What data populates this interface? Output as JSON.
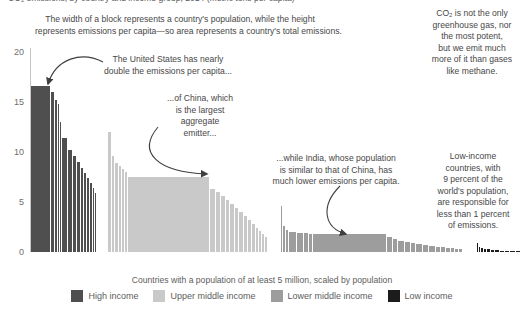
{
  "clipped_title": "CO₂ emissions, by country and income group, 2014 (metric tons per capita)",
  "annotations": {
    "width_note": {
      "lines": [
        "The width of a block represents a country's population, while the height",
        "represents emissions per capita—so area represents a country's total emissions."
      ]
    },
    "us_note": {
      "lines": [
        "The United States has nearly",
        "double the emissions per capita..."
      ]
    },
    "china_note": {
      "lines": [
        "...of China, which",
        "is the largest",
        "aggregate",
        "emitter..."
      ]
    },
    "india_note": {
      "lines": [
        "...while India, whose population",
        "is similar to that of China, has",
        "much lower emissions per capita."
      ]
    },
    "co2_note": {
      "lines": [
        "CO₂ is not the only",
        "greenhouse gas, nor",
        "the most potent,",
        "but we emit much",
        "more of it than gases",
        "like methane."
      ]
    },
    "low_income_note": {
      "lines": [
        "Low-income",
        "countries, with",
        "9 percent of the",
        "world's population,",
        "are responsible for",
        "less than 1 percent",
        "of emissions."
      ]
    }
  },
  "legend": {
    "items": [
      {
        "label": "High income",
        "color": "#4f4f4f"
      },
      {
        "label": "Upper middle income",
        "color": "#c9c9c9"
      },
      {
        "label": "Lower middle income",
        "color": "#9d9d9d"
      },
      {
        "label": "Low income",
        "color": "#1c1c1c"
      }
    ]
  },
  "chart_data": {
    "type": "bar",
    "variant": "marimekko — bar width proportional to country population, bar height = CO2 emissions per capita",
    "xlabel": "Countries with a population of at least 5 million, scaled by population",
    "ylabel": "metric tons per capita",
    "ylim": [
      0,
      20
    ],
    "yticks": [
      0,
      5,
      10,
      15,
      20
    ],
    "grid": false,
    "legend_position": "bottom",
    "highlight_values": {
      "united_states": 16.6,
      "china": 7.5,
      "india": 1.8
    },
    "series": [
      {
        "name": "High income",
        "color": "#4f4f4f",
        "x_start": 31,
        "bars": [
          [
            20,
            16.6,
            "United States"
          ],
          [
            4,
            16.0
          ],
          [
            3,
            15.2
          ],
          [
            2,
            14.8
          ],
          [
            2,
            13.0
          ],
          [
            6,
            11.4
          ],
          [
            5,
            10.2
          ],
          [
            4,
            9.6
          ],
          [
            4,
            9.0
          ],
          [
            3,
            8.4
          ],
          [
            3,
            7.9
          ],
          [
            3,
            7.4
          ],
          [
            3,
            6.9
          ],
          [
            2,
            6.4
          ],
          [
            2,
            5.9
          ]
        ]
      },
      {
        "name": "Upper middle income",
        "color": "#c9c9c9",
        "x_start": 108,
        "bars": [
          [
            4,
            12.0
          ],
          [
            3,
            9.6
          ],
          [
            4,
            8.9
          ],
          [
            3,
            8.6
          ],
          [
            3,
            8.3
          ],
          [
            3,
            8.0
          ],
          [
            82,
            7.5,
            "China"
          ],
          [
            6,
            6.3
          ],
          [
            5,
            6.0
          ],
          [
            5,
            5.6
          ],
          [
            4,
            5.2
          ],
          [
            5,
            4.8
          ],
          [
            4,
            4.4
          ],
          [
            5,
            4.0
          ],
          [
            4,
            3.6
          ],
          [
            4,
            3.2
          ],
          [
            4,
            2.8
          ],
          [
            3,
            2.4
          ],
          [
            3,
            2.1
          ],
          [
            3,
            1.8
          ],
          [
            3,
            1.5
          ]
        ]
      },
      {
        "name": "Lower middle income",
        "color": "#9d9d9d",
        "x_start": 281,
        "bars": [
          [
            2,
            4.6
          ],
          [
            3,
            2.6
          ],
          [
            3,
            2.2
          ],
          [
            8,
            2.05
          ],
          [
            7,
            1.95
          ],
          [
            5,
            1.9
          ],
          [
            4,
            1.85
          ],
          [
            74,
            1.8,
            "India"
          ],
          [
            6,
            1.5
          ],
          [
            5,
            1.3
          ],
          [
            7,
            1.1
          ],
          [
            6,
            1.0
          ],
          [
            5,
            0.9
          ],
          [
            7,
            0.8
          ],
          [
            6,
            0.7
          ],
          [
            7,
            0.6
          ],
          [
            5,
            0.55
          ],
          [
            5,
            0.5
          ],
          [
            5,
            0.45
          ],
          [
            4,
            0.4
          ],
          [
            4,
            0.35
          ],
          [
            4,
            0.3
          ]
        ]
      },
      {
        "name": "Low income",
        "color": "#1c1c1c",
        "x_start": 477,
        "bars": [
          [
            2,
            0.95
          ],
          [
            2,
            0.55
          ],
          [
            3,
            0.45
          ],
          [
            3,
            0.35
          ],
          [
            4,
            0.28
          ],
          [
            4,
            0.22
          ],
          [
            5,
            0.18
          ],
          [
            5,
            0.14
          ],
          [
            5,
            0.11
          ],
          [
            6,
            0.08
          ],
          [
            5,
            0.06
          ]
        ]
      }
    ]
  }
}
